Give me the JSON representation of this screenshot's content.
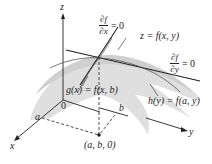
{
  "diagram": {
    "axes": {
      "z_label": "z",
      "x_label": "x",
      "y_label": "y",
      "origin_label": "0"
    },
    "surface_label": "z = f(x, y)",
    "partial_x": {
      "numerator": "∂f",
      "denominator": "∂x",
      "equals": "= 0"
    },
    "partial_y": {
      "numerator": "∂f",
      "denominator": "∂y",
      "equals": "= 0"
    },
    "curve_g_label": "g(x) = f(x, b)",
    "curve_h_label": "h(y) = f(a, y)",
    "point_a_label": "a",
    "point_b_label": "b",
    "base_point_label": "(a, b, 0)",
    "colors": {
      "surface": "#d9d9d9",
      "lines": "#222222"
    }
  }
}
